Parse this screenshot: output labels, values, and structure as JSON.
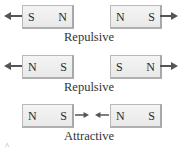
{
  "rows": [
    {
      "left_magnet": {
        "left_pole": "S",
        "right_pole": "N"
      },
      "right_magnet": {
        "left_pole": "N",
        "right_pole": "S"
      },
      "label": "Repulsive",
      "force": "outward"
    },
    {
      "left_magnet": {
        "left_pole": "N",
        "right_pole": "S"
      },
      "right_magnet": {
        "left_pole": "S",
        "right_pole": "N"
      },
      "label": "Repulsive",
      "force": "outward"
    },
    {
      "left_magnet": {
        "left_pole": "N",
        "right_pole": "S"
      },
      "right_magnet": {
        "left_pole": "N",
        "right_pole": "S"
      },
      "label": "Attractive",
      "force": "inward"
    }
  ],
  "colors": {
    "arrow": "#555555",
    "magnet_fill": "#efefef",
    "magnet_border": "#b5b5b5"
  },
  "caret_icon": "^"
}
